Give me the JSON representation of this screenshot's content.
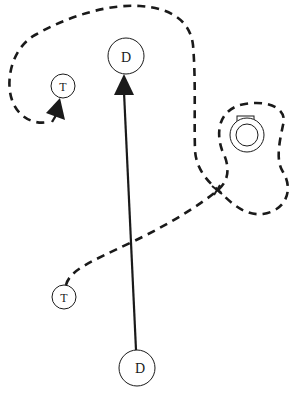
{
  "caption": {
    "partial_text": ""
  },
  "nodes": {
    "defender_top": {
      "label": "D"
    },
    "defender_bottom": {
      "label": "D"
    },
    "target_top": {
      "label": "T"
    },
    "target_bottom": {
      "label": "T"
    }
  },
  "objects": {
    "landmark": {
      "name": "obstacle"
    }
  },
  "paths": {
    "solid_arrow": {
      "style": "solid",
      "from": "defender_bottom",
      "to": "defender_top"
    },
    "dashed_path": {
      "style": "dashed",
      "from": "target_bottom",
      "to": "target_top"
    }
  },
  "colors": {
    "stroke": "#1a1a1a",
    "background": "#ffffff"
  }
}
